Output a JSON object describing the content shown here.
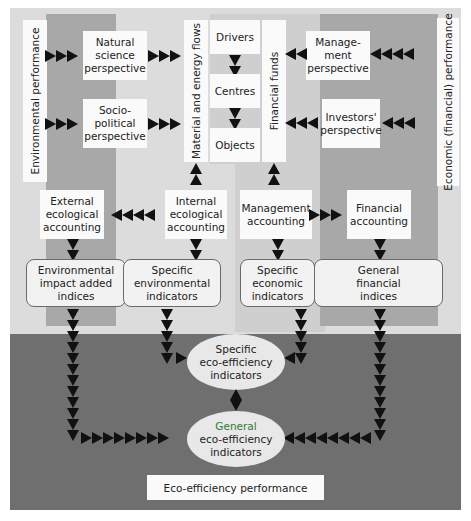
{
  "diagram": {
    "side_labels": {
      "environmental_performance": "Environmental performance",
      "economic_performance": "Economic (financial) performance",
      "material_flows": "Material and energy flows",
      "financial_funds": "Financial funds"
    },
    "perspectives": {
      "natural_science": "Natural science perspective",
      "natural_science_lines": [
        "Natural",
        "science",
        "perspective"
      ],
      "socio_political_lines": [
        "Socio-",
        "political",
        "perspective"
      ],
      "management_lines": [
        "Manage-",
        "ment",
        "perspective"
      ],
      "investors_lines": [
        "Investors'",
        "perspective"
      ]
    },
    "center_stack": {
      "drivers": "Drivers",
      "centres": "Centres",
      "objects": "Objects"
    },
    "accounting": {
      "external_lines": [
        "External",
        "ecological",
        "accounting"
      ],
      "internal_lines": [
        "Internal",
        "ecological",
        "accounting"
      ],
      "management_lines": [
        "Management",
        "accounting"
      ],
      "financial_lines": [
        "Financial",
        "accounting"
      ]
    },
    "indicators": {
      "env_impact_lines": [
        "Environmental",
        "impact added",
        "indices"
      ],
      "specific_env_lines": [
        "Specific",
        "environmental",
        "indicators"
      ],
      "specific_econ_lines": [
        "Specific",
        "economic",
        "indicators"
      ],
      "general_fin_lines": [
        "General",
        "financial",
        "indices"
      ]
    },
    "eco_efficiency": {
      "specific_lines": [
        "Specific",
        "eco-efficiency",
        "indicators"
      ],
      "general_lines": [
        "General",
        "eco-efficiency",
        "indicators"
      ],
      "performance": "Eco-efficiency performance"
    },
    "colors": {
      "light_panel": "#dcdcdc",
      "dark_band": "#a8a8a8",
      "bottom_panel": "#6f6f6f",
      "arrow": "#111111",
      "general_highlight": "#2e7d32"
    }
  }
}
